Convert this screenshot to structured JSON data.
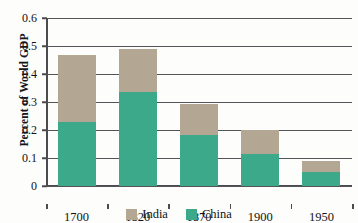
{
  "chart_data": {
    "type": "bar",
    "subtype": "stacked-bar",
    "title": "",
    "xlabel": "",
    "ylabel": "Percent of World GDP",
    "categories": [
      "1700",
      "1820",
      "1870",
      "1900",
      "1950"
    ],
    "series": [
      {
        "name": "China",
        "color": "#3da98b",
        "values": [
          0.229,
          0.334,
          0.182,
          0.114,
          0.05
        ]
      },
      {
        "name": "India",
        "color": "#b3a794",
        "values": [
          0.239,
          0.155,
          0.111,
          0.086,
          0.039
        ]
      }
    ],
    "totals": [
      0.468,
      0.489,
      0.293,
      0.2,
      0.089
    ],
    "stack_order": [
      "China",
      "India"
    ],
    "ylim": [
      0,
      0.6
    ],
    "yticks": [
      0,
      0.1,
      0.2,
      0.3,
      0.4,
      0.5,
      0.6
    ],
    "ytick_labels": [
      "0",
      "0.1",
      "0.2",
      "0.3",
      "0.4",
      "0.5",
      "0.6"
    ],
    "grid": true,
    "grid_axis": "y",
    "legend_position": "bottom",
    "legend_entries": [
      "India",
      "China"
    ]
  },
  "axes": {
    "y_title": "Percent of World GDP",
    "y_ticks": [
      {
        "label": "0.6",
        "value": 0.6
      },
      {
        "label": "0.5",
        "value": 0.5
      },
      {
        "label": "0.4",
        "value": 0.4
      },
      {
        "label": "0.3",
        "value": 0.3
      },
      {
        "label": "0.2",
        "value": 0.2
      },
      {
        "label": "0.1",
        "value": 0.1
      },
      {
        "label": "0",
        "value": 0.0
      }
    ],
    "x_ticks": [
      {
        "label": "1700"
      },
      {
        "label": "1820"
      },
      {
        "label": "1870"
      },
      {
        "label": "1900"
      },
      {
        "label": "1950"
      }
    ]
  },
  "legend": {
    "items": [
      {
        "label": "India",
        "color": "#b3a794",
        "swatch": "india-swatch"
      },
      {
        "label": "China",
        "color": "#3da98b",
        "swatch": "china-swatch"
      }
    ]
  },
  "colors": {
    "india": "#b3a794",
    "china": "#3da98b",
    "axis": "#4c4c50",
    "grid": "#545458",
    "text": "#121214",
    "background": "#fdfdfb"
  }
}
